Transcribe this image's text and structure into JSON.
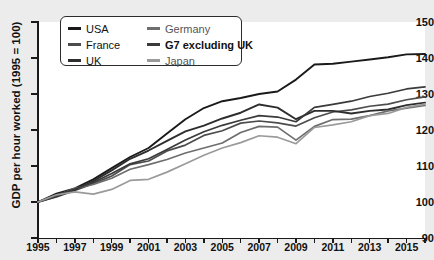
{
  "chart_data": {
    "type": "line",
    "title": "",
    "xlabel": "",
    "ylabel": "GDP per hour worked (1995 = 100)",
    "ylim": [
      90,
      150
    ],
    "xlim": [
      1995,
      2016
    ],
    "y_ticks": [
      90,
      100,
      110,
      120,
      130,
      140,
      150
    ],
    "x_ticks": [
      1995,
      1997,
      1999,
      2001,
      2003,
      2005,
      2007,
      2009,
      2011,
      2013,
      2015
    ],
    "x_minor_ticks": [
      1996,
      1998,
      2000,
      2002,
      2004,
      2006,
      2008,
      2010,
      2012,
      2014,
      2016
    ],
    "grid": false,
    "legend_position": "top-left",
    "x": [
      1995,
      1996,
      1997,
      1998,
      1999,
      2000,
      2001,
      2002,
      2003,
      2004,
      2005,
      2006,
      2007,
      2008,
      2009,
      2010,
      2011,
      2012,
      2013,
      2014,
      2015,
      2016
    ],
    "series": [
      {
        "name": "USA",
        "color": "#1a1a1a",
        "width": 1.9,
        "values": [
          100.0,
          102.3,
          103.8,
          106.3,
          109.4,
          112.5,
          115.0,
          119.0,
          123.0,
          126.1,
          128.0,
          128.9,
          130.0,
          130.7,
          134.0,
          138.2,
          138.4,
          139.0,
          139.6,
          140.2,
          141.0,
          141.1
        ]
      },
      {
        "name": "France",
        "color": "#4c4c4c",
        "width": 1.7,
        "values": [
          100.0,
          101.4,
          103.2,
          105.1,
          107.2,
          110.4,
          111.4,
          114.2,
          115.8,
          118.5,
          119.8,
          121.9,
          122.5,
          122.0,
          121.1,
          123.4,
          125.0,
          125.6,
          126.6,
          127.2,
          128.4,
          129.2
        ]
      },
      {
        "name": "UK",
        "color": "#2e2e2e",
        "width": 1.9,
        "values": [
          100.0,
          101.6,
          103.4,
          105.8,
          108.8,
          112.0,
          114.3,
          117.0,
          119.6,
          121.2,
          123.2,
          124.8,
          127.1,
          126.2,
          123.0,
          125.3,
          125.3,
          124.6,
          125.3,
          125.7,
          126.9,
          127.6
        ]
      },
      {
        "name": "Germany",
        "color": "#6e6e6e",
        "width": 1.7,
        "values": [
          100.0,
          101.8,
          103.8,
          104.9,
          106.6,
          109.1,
          110.4,
          111.8,
          113.6,
          115.0,
          116.4,
          119.3,
          121.0,
          120.8,
          117.2,
          121.0,
          122.9,
          123.0,
          124.0,
          125.3,
          126.1,
          126.8
        ]
      },
      {
        "name": "G7 excluding UK",
        "color": "#3a3a3a",
        "width": 1.7,
        "values": [
          100.0,
          101.9,
          103.6,
          105.4,
          107.9,
          110.6,
          112.0,
          114.6,
          117.2,
          119.5,
          121.3,
          122.7,
          124.0,
          123.6,
          122.3,
          126.3,
          127.1,
          128.0,
          129.3,
          130.2,
          131.4,
          132.0
        ]
      },
      {
        "name": "Japan",
        "color": "#9a9a9a",
        "width": 1.7,
        "values": [
          100.0,
          102.0,
          102.8,
          102.2,
          103.5,
          106.0,
          106.3,
          108.3,
          110.6,
          113.0,
          115.0,
          116.5,
          118.4,
          118.0,
          116.2,
          120.7,
          121.4,
          122.3,
          124.0,
          124.6,
          126.3,
          127.2
        ]
      }
    ]
  },
  "legend": {
    "columns": [
      {
        "items": [
          {
            "label": "USA",
            "color": "#1a1a1a",
            "bold": false
          },
          {
            "label": "France",
            "color": "#4c4c4c",
            "bold": false
          },
          {
            "label": "UK",
            "color": "#2e2e2e",
            "bold": false
          }
        ]
      },
      {
        "items": [
          {
            "label": "Germany",
            "color": "#6e6e6e",
            "bold": false
          },
          {
            "label": "G7 excluding UK",
            "color": "#3a3a3a",
            "bold": true
          },
          {
            "label": "Japan",
            "color": "#9a9a9a",
            "bold": false
          }
        ]
      }
    ]
  },
  "colors": {
    "plot_background": "#ffffff",
    "page_background": "#ececec",
    "axis": "#1a1a1a",
    "text": "#111111"
  }
}
